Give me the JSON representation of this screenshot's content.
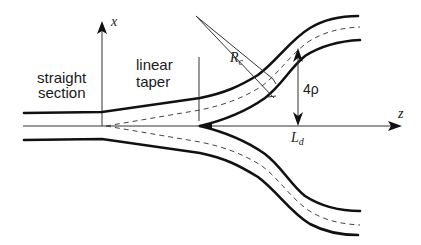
{
  "diagram": {
    "type": "y-branch waveguide splitter schematic",
    "regions": {
      "straight_section": [
        "straight",
        "section"
      ],
      "linear_taper": [
        "linear",
        "taper"
      ]
    },
    "axes": {
      "x_label": "x",
      "z_label": "z"
    },
    "annotations": {
      "radius_main": "R",
      "radius_sub": "c",
      "separation": "4ρ",
      "length_main": "L",
      "length_sub": "d"
    },
    "colors": {
      "stroke": "#111111",
      "thin_stroke": "#333333",
      "dashed": "#444444",
      "background": "#ffffff"
    }
  }
}
